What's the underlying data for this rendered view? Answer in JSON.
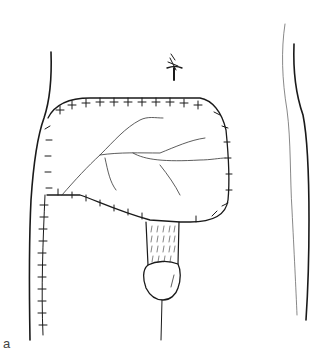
{
  "figure": {
    "panel_label": "a",
    "colors": {
      "stroke": "#1a1a1a",
      "light_stroke": "#555555",
      "background": "#ffffff"
    },
    "elements": [
      "torso-outline-left",
      "torso-outline-right",
      "umbilicus",
      "sutured-flap",
      "flap-vessels",
      "vertical-suture-line",
      "tubed-graft",
      "penile-glans",
      "raphe-line"
    ]
  }
}
